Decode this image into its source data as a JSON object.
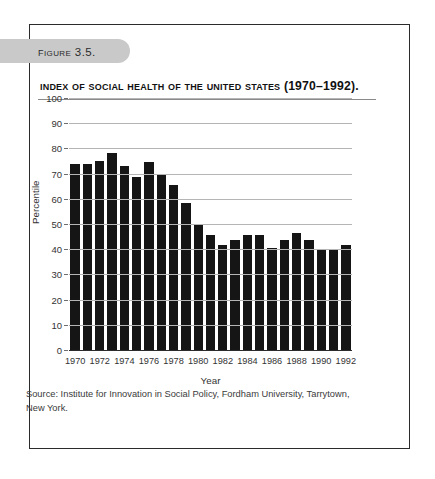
{
  "figure": {
    "badge_label": "Figure 3.5.",
    "title": "Index of Social Health of the United States (1970–1992).",
    "source_note": "Source: Institute for Innovation in Social Policy, Fordham University, Tarrytown, New York."
  },
  "chart_data": {
    "type": "bar",
    "title": "Index of Social Health of the United States (1970–1992).",
    "xlabel": "Year",
    "ylabel": "Percentile",
    "ylim": [
      0,
      100
    ],
    "ytick_values": [
      0,
      10,
      20,
      30,
      40,
      50,
      60,
      70,
      80,
      90,
      100
    ],
    "ytick_labels": [
      "0",
      "10",
      "20",
      "30",
      "40",
      "50",
      "60",
      "70",
      "80",
      "90",
      "100"
    ],
    "xtick_labels": [
      "1970",
      "1972",
      "1974",
      "1976",
      "1978",
      "1980",
      "1982",
      "1984",
      "1986",
      "1988",
      "1990",
      "1992"
    ],
    "grid": true,
    "legend": null,
    "bar_color": "#151515",
    "categories": [
      "1970",
      "1971",
      "1972",
      "1973",
      "1974",
      "1975",
      "1976",
      "1977",
      "1978",
      "1979",
      "1980",
      "1981",
      "1982",
      "1983",
      "1984",
      "1985",
      "1986",
      "1987",
      "1988",
      "1989",
      "1990",
      "1991",
      "1992"
    ],
    "values": [
      74,
      74,
      75,
      78,
      73,
      68.5,
      74.5,
      69.5,
      65.5,
      58.5,
      50,
      45.5,
      41.5,
      43.5,
      45.5,
      45.5,
      40.5,
      43.5,
      46.5,
      43.5,
      39.5,
      39.5,
      41.5
    ]
  }
}
